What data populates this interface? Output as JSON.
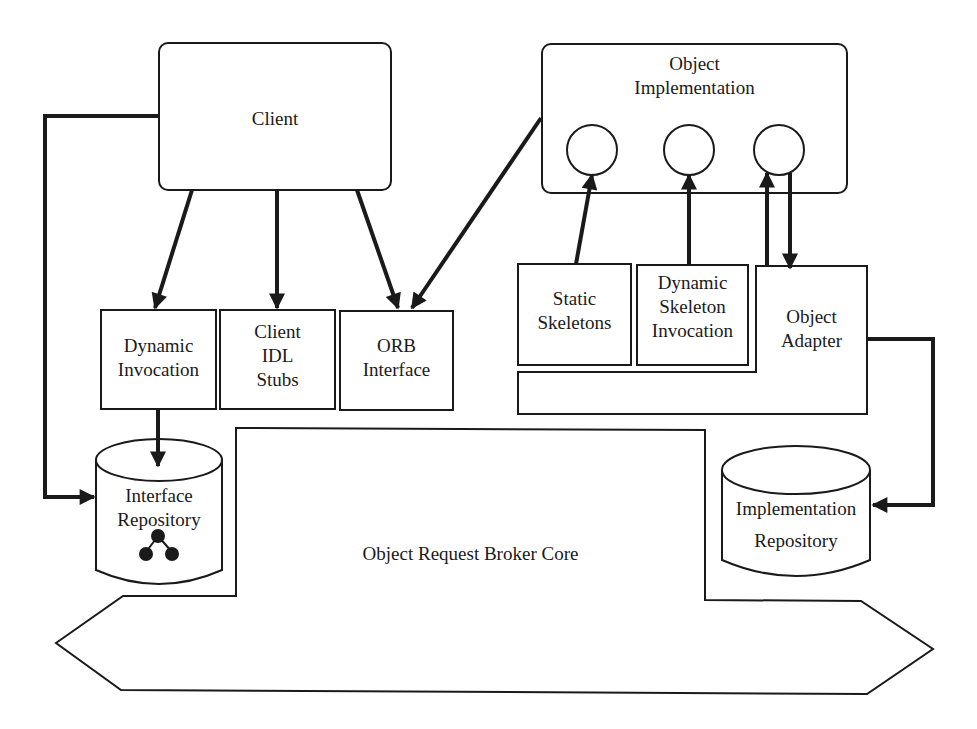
{
  "diagram": {
    "colors": {
      "stroke": "#1a1a1a",
      "background": "#ffffff",
      "text": "#1a1a1a"
    },
    "nodes": {
      "client": {
        "lines": [
          "Client"
        ]
      },
      "object_implementation": {
        "lines": [
          "Object",
          "Implementation"
        ]
      },
      "dynamic_invocation": {
        "lines": [
          "Dynamic",
          "Invocation"
        ]
      },
      "client_idl_stubs": {
        "lines": [
          "Client",
          "IDL",
          "Stubs"
        ]
      },
      "orb_interface": {
        "lines": [
          "ORB",
          "Interface"
        ]
      },
      "static_skeletons": {
        "lines": [
          "Static",
          "Skeletons"
        ]
      },
      "dynamic_skeleton_invocation": {
        "lines": [
          "Dynamic",
          "Skeleton",
          "Invocation"
        ]
      },
      "object_adapter": {
        "lines": [
          "Object",
          "Adapter"
        ]
      },
      "interface_repository": {
        "lines": [
          "Interface",
          "Repository"
        ],
        "icon": "tree-graph-icon"
      },
      "implementation_repository": {
        "lines": [
          "Implementation",
          "Repository"
        ]
      },
      "orb_core": {
        "lines": [
          "Object Request Broker Core"
        ]
      }
    },
    "edges": [
      {
        "from": "client",
        "to": "dynamic_invocation"
      },
      {
        "from": "client",
        "to": "client_idl_stubs"
      },
      {
        "from": "client",
        "to": "orb_interface"
      },
      {
        "from": "client",
        "to": "interface_repository"
      },
      {
        "from": "object_implementation",
        "to": "orb_interface"
      },
      {
        "from": "static_skeletons",
        "to": "object_implementation"
      },
      {
        "from": "dynamic_skeleton_invocation",
        "to": "object_implementation"
      },
      {
        "from": "object_adapter",
        "to": "object_implementation"
      },
      {
        "from": "object_implementation",
        "to": "object_adapter"
      },
      {
        "from": "dynamic_invocation",
        "to": "interface_repository"
      },
      {
        "from": "object_adapter",
        "to": "implementation_repository"
      }
    ]
  }
}
